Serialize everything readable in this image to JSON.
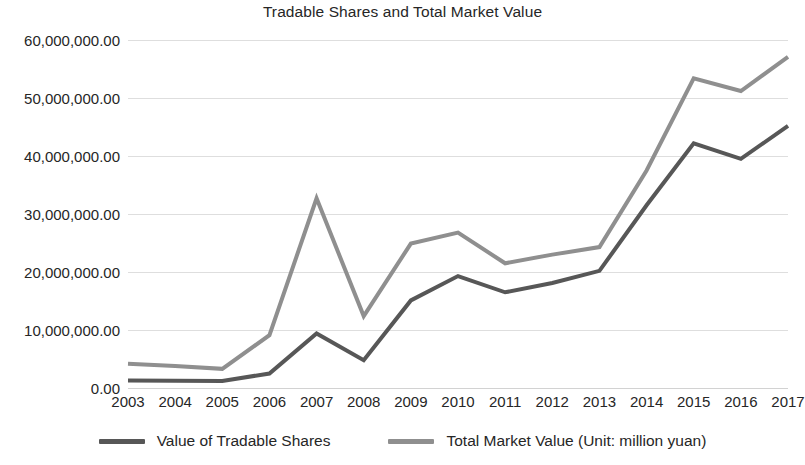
{
  "chart_data": {
    "type": "line",
    "title": "Tradable Shares and Total Market Value",
    "xlabel": "",
    "ylabel": "",
    "categories": [
      "2003",
      "2004",
      "2005",
      "2006",
      "2007",
      "2008",
      "2009",
      "2010",
      "2011",
      "2012",
      "2013",
      "2014",
      "2015",
      "2016",
      "2017"
    ],
    "series": [
      {
        "name": "Value of Tradable Shares",
        "color": "#575757",
        "values": [
          1300000.0,
          1250000.0,
          1200000.0,
          2500000.0,
          9400000.0,
          4800000.0,
          15100000.0,
          19300000.0,
          16500000.0,
          18100000.0,
          20200000.0,
          31500000.0,
          42200000.0,
          39500000.0,
          45200000.0
        ]
      },
      {
        "name": "Total Market Value (Unit: million yuan)",
        "color": "#8f8f8f",
        "values": [
          4200000.0,
          3800000.0,
          3300000.0,
          9100000.0,
          32700000.0,
          12400000.0,
          24900000.0,
          26800000.0,
          21500000.0,
          23000000.0,
          24300000.0,
          37500000.0,
          53400000.0,
          51200000.0,
          57100000.0
        ]
      }
    ],
    "ylim": [
      0,
      60000000
    ],
    "ytick_values": [
      0,
      10000000,
      20000000,
      30000000,
      40000000,
      50000000,
      60000000
    ],
    "ytick_labels": [
      "0.00",
      "10,000,000.00",
      "20,000,000.00",
      "30,000,000.00",
      "40,000,000.00",
      "50,000,000.00",
      "60,000,000.00"
    ],
    "grid": true,
    "grid_color": "#dedede",
    "legend_position": "bottom"
  },
  "legend": {
    "items": [
      {
        "label": "Value of Tradable Shares",
        "color": "#575757"
      },
      {
        "label": "Total Market Value (Unit: million yuan)",
        "color": "#8f8f8f"
      }
    ]
  }
}
